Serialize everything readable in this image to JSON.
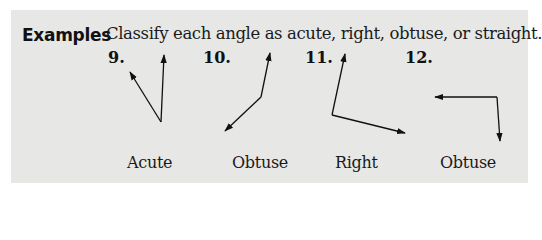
{
  "section": {
    "heading": "Examples",
    "instruction": "Classify each angle as acute, right, obtuse, or straight."
  },
  "problems": [
    {
      "number": "9.",
      "answer": "Acute",
      "vertex": [
        161,
        122
      ],
      "rays": [
        [
          164,
          55
        ],
        [
          130,
          72
        ]
      ]
    },
    {
      "number": "10.",
      "answer": "Obtuse",
      "vertex": [
        261,
        97
      ],
      "rays": [
        [
          270,
          53
        ],
        [
          225,
          131
        ]
      ]
    },
    {
      "number": "11.",
      "answer": "Right",
      "vertex": [
        332,
        115
      ],
      "rays": [
        [
          345,
          54
        ],
        [
          405,
          133
        ]
      ]
    },
    {
      "number": "12.",
      "answer": "Obtuse",
      "vertex": [
        497,
        97
      ],
      "rays": [
        [
          435,
          97
        ],
        [
          500,
          141
        ]
      ]
    }
  ],
  "colors": {
    "panel": "#e7e7e6",
    "ink": "#111111"
  }
}
